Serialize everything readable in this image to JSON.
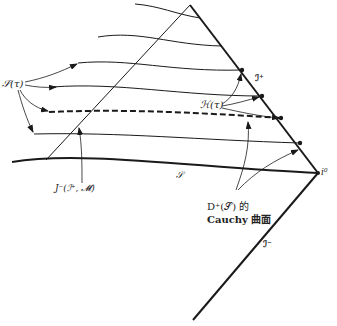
{
  "diagram": {
    "type": "penrose-diagram",
    "labels": {
      "sigma_tau": "𝒮(τ)",
      "script_i_plus": "ℐ⁺",
      "script_h_tau": "ℋ(τ)",
      "i_zero": "i⁰",
      "script_s": "𝒮",
      "script_i_minus": "ℐ⁻",
      "j_minus": "J⁻(ℐ⁺, 𝓜̄)",
      "d_plus_line1": "D⁺(𝒮) 的",
      "d_plus_line2": "Cauchy 曲面"
    },
    "points": {
      "apex": [
        190,
        5
      ],
      "i0": [
        318,
        173
      ],
      "bottom": [
        193,
        320
      ]
    },
    "dots_on_scri_plus": [
      [
        242,
        70
      ],
      [
        262,
        96
      ],
      [
        281,
        118
      ],
      [
        300,
        143
      ]
    ],
    "colors": {
      "stroke": "#1a1a1a",
      "background": "#ffffff"
    }
  }
}
